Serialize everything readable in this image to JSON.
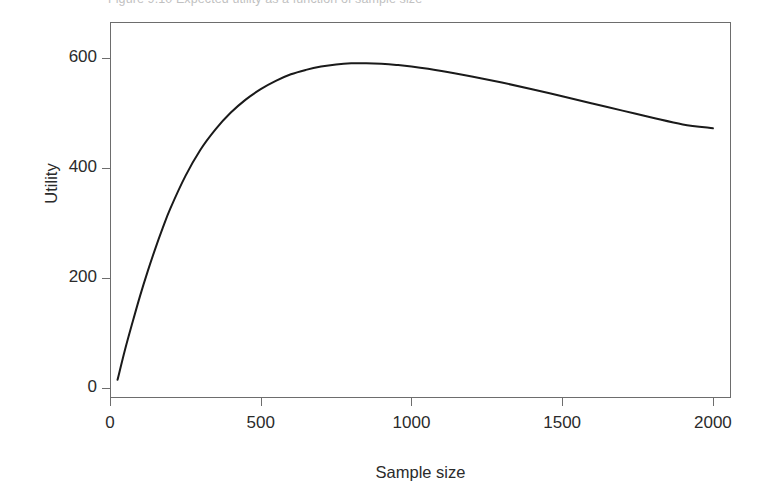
{
  "figure": {
    "caption": "Figure 9.10  Expected utility as a function of sample size"
  },
  "chart_data": {
    "type": "line",
    "title": "",
    "xlabel": "Sample size",
    "ylabel": "Utility",
    "xlim": [
      0,
      2060
    ],
    "ylim": [
      -18,
      665
    ],
    "grid": false,
    "legend": null,
    "xticks": [
      0,
      500,
      1000,
      1500,
      2000
    ],
    "xtick_labels": [
      "0",
      "500",
      "1000",
      "1500",
      "2000"
    ],
    "yticks": [
      0,
      200,
      400,
      600
    ],
    "ytick_labels": [
      "0",
      "200",
      "400",
      "600"
    ],
    "series": [
      {
        "name": "Expected utility",
        "color": "#1a1a1a",
        "line_width": 2,
        "x": [
          25,
          50,
          75,
          100,
          125,
          150,
          175,
          200,
          250,
          300,
          350,
          400,
          450,
          500,
          550,
          600,
          650,
          700,
          750,
          800,
          850,
          900,
          950,
          1000,
          1100,
          1200,
          1300,
          1400,
          1500,
          1600,
          1700,
          1800,
          1900,
          2000
        ],
        "y": [
          15,
          70,
          120,
          168,
          212,
          253,
          291,
          326,
          385,
          433,
          470,
          500,
          524,
          543,
          558,
          570,
          578,
          584,
          588,
          590,
          590,
          589,
          587,
          584,
          576,
          566,
          555,
          543,
          530,
          517,
          504,
          491,
          479,
          472
        ]
      }
    ]
  },
  "axis": {
    "y_title": "Utility",
    "x_title": "Sample size"
  }
}
